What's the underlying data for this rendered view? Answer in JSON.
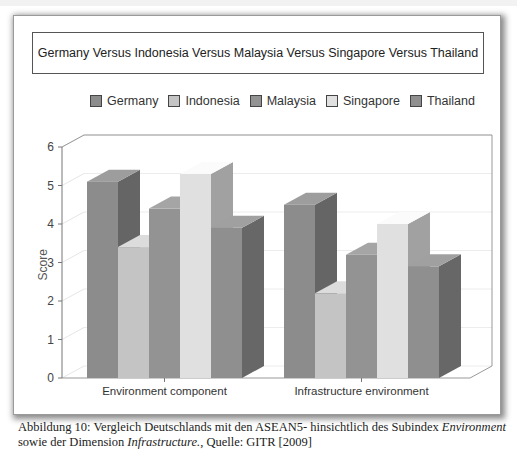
{
  "chart_data": {
    "type": "bar",
    "style": "3d-clustered-column",
    "title": "Germany Versus Indonesia Versus Malaysia Versus Singapore Versus Thailand",
    "xlabel": "",
    "ylabel": "Score",
    "ylim": [
      0,
      6
    ],
    "yticks": [
      0,
      1,
      2,
      3,
      4,
      5,
      6
    ],
    "grid": true,
    "legend_position": "top",
    "categories": [
      "Environment component",
      "Infrastructure environment"
    ],
    "series": [
      {
        "name": "Germany",
        "color": "#8c8c8c",
        "values": [
          5.1,
          4.5
        ]
      },
      {
        "name": "Indonesia",
        "color": "#c4c4c4",
        "values": [
          3.4,
          2.2
        ]
      },
      {
        "name": "Malaysia",
        "color": "#939393",
        "values": [
          4.4,
          3.2
        ]
      },
      {
        "name": "Singapore",
        "color": "#e0e0e0",
        "values": [
          5.3,
          4.0
        ]
      },
      {
        "name": "Thailand",
        "color": "#8f8f8f",
        "values": [
          3.9,
          2.9
        ]
      }
    ]
  },
  "caption": {
    "prefix": "Abbildung 10: Vergleich Deutschlands mit den ASEAN5- hinsichtlich des Subindex ",
    "italic1": "Environment",
    "middle": " sowie der Dimension ",
    "italic2": "Infrastructure.",
    "suffix": ", Quelle: GITR [2009]"
  }
}
